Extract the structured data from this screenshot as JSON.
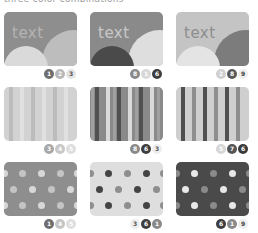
{
  "title": "three-color combinations",
  "palette": {
    "1": "#6e6e6e",
    "2": "#b8b8b8",
    "3": "#dcdcdc",
    "4": "#c8c8c8",
    "5": "#e0e0e0",
    "6": "#3e3e3e",
    "7": "#505050",
    "8": "#8a8a8a",
    "9": "#808080"
  },
  "rows": [
    {
      "pattern": "circles",
      "cards": [
        {
          "text": "text",
          "bg": "#8e8e8e",
          "text_color": "#b4b4b4",
          "c1": "#dadada",
          "c2": "#bdbdbd",
          "swatches": [
            {
              "n": "1",
              "bg": "#6e6e6e",
              "fg": "#ffffff"
            },
            {
              "n": "2",
              "bg": "#b8b8b8",
              "fg": "#ffffff"
            },
            {
              "n": "3",
              "bg": "#e4e4e4",
              "fg": "#555555"
            }
          ]
        },
        {
          "text": "text",
          "bg": "#8a8a8a",
          "text_color": "#c8c8c8",
          "c1": "#4a4a4a",
          "c2": "#dedede",
          "swatches": [
            {
              "n": "8",
              "bg": "#8a8a8a",
              "fg": "#ffffff"
            },
            {
              "n": "1",
              "bg": "#d8d8d8",
              "fg": "#ffffff"
            },
            {
              "n": "6",
              "bg": "#3e3e3e",
              "fg": "#ffffff"
            }
          ]
        },
        {
          "text": "text",
          "bg": "#c4c4c4",
          "text_color": "#8e8e8e",
          "c1": "#e4e4e4",
          "c2": "#7c7c7c",
          "swatches": [
            {
              "n": "2",
              "bg": "#cfcfcf",
              "fg": "#ffffff"
            },
            {
              "n": "8",
              "bg": "#5a5a5a",
              "fg": "#ffffff"
            },
            {
              "n": "9",
              "bg": "#eeeeee",
              "fg": "#444444"
            }
          ]
        }
      ]
    },
    {
      "pattern": "stripes",
      "cards": [
        {
          "bg": "#d2d2d2",
          "stripe_a": "#bcbcbc",
          "stripe_b": "#e0e0e0",
          "swatches": [
            {
              "n": "3",
              "bg": "#a8a8a8",
              "fg": "#ffffff"
            },
            {
              "n": "4",
              "bg": "#c8c8c8",
              "fg": "#ffffff"
            },
            {
              "n": "5",
              "bg": "#dedede",
              "fg": "#ffffff"
            }
          ]
        },
        {
          "bg": "#8a8a8a",
          "stripe_a": "#505050",
          "stripe_b": "#dadada",
          "swatches": [
            {
              "n": "8",
              "bg": "#8a8a8a",
              "fg": "#ffffff"
            },
            {
              "n": "6",
              "bg": "#3e3e3e",
              "fg": "#ffffff"
            },
            {
              "n": "3",
              "bg": "#eeeeee",
              "fg": "#555555"
            }
          ]
        },
        {
          "bg": "#cfcfcf",
          "stripe_a": "#505050",
          "stripe_b": "#8e8e8e",
          "swatches": [
            {
              "n": "5",
              "bg": "#d6d6d6",
              "fg": "#ffffff"
            },
            {
              "n": "7",
              "bg": "#555555",
              "fg": "#ffffff"
            },
            {
              "n": "6",
              "bg": "#3a3a3a",
              "fg": "#ffffff"
            }
          ]
        }
      ]
    },
    {
      "pattern": "dots",
      "cards": [
        {
          "bg": "#8e8e8e",
          "dot_a": "#c4c4c4",
          "dot_b": "#d8d8d8",
          "swatches": [
            {
              "n": "1",
              "bg": "#6e6e6e",
              "fg": "#ffffff"
            },
            {
              "n": "4",
              "bg": "#c4c4c4",
              "fg": "#ffffff"
            },
            {
              "n": "5",
              "bg": "#dedede",
              "fg": "#ffffff"
            }
          ]
        },
        {
          "bg": "#dedede",
          "dot_a": "#444444",
          "dot_b": "#8e8e8e",
          "swatches": [
            {
              "n": "3",
              "bg": "#eeeeee",
              "fg": "#555555"
            },
            {
              "n": "6",
              "bg": "#3e3e3e",
              "fg": "#ffffff"
            },
            {
              "n": "1",
              "bg": "#8a8a8a",
              "fg": "#ffffff"
            }
          ]
        },
        {
          "bg": "#4a4a4a",
          "dot_a": "#e8e8e8",
          "dot_b": "#8a8a8a",
          "swatches": [
            {
              "n": "6",
              "bg": "#3e3e3e",
              "fg": "#ffffff"
            },
            {
              "n": "1",
              "bg": "#8a8a8a",
              "fg": "#ffffff"
            },
            {
              "n": "9",
              "bg": "#eeeeee",
              "fg": "#444444"
            }
          ]
        }
      ]
    }
  ]
}
